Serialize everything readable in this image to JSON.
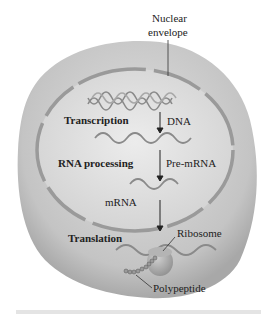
{
  "labels": {
    "nuclear_envelope_line1": "Nuclear",
    "nuclear_envelope_line2": "envelope",
    "transcription": "Transcription",
    "dna": "DNA",
    "rna_processing": "RNA processing",
    "pre_mrna": "Pre-mRNA",
    "mrna": "mRNA",
    "translation": "Translation",
    "ribosome": "Ribosome",
    "polypeptide": "Polypeptide"
  },
  "colors": {
    "cell_fill": "#c8c8c8",
    "nucleus_fill": "#dcdcdc",
    "envelope": "#9a9a9a",
    "strand": "#8a8a8a",
    "ribosome": "#a8a8a8",
    "arrow": "#222222"
  }
}
